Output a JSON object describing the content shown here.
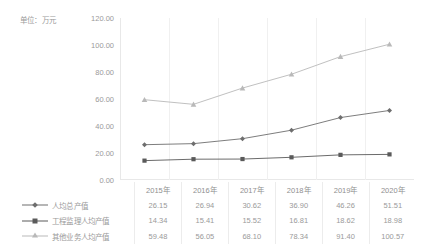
{
  "unit_caption": "单位：万元",
  "colors": {
    "series_total": "#6e6e6e",
    "series_supervision": "#5a5a5a",
    "series_other": "#b9b9b9",
    "grid": "#f0f0f0",
    "axis": "#e8e8e8",
    "text": "#9a9a9a",
    "table_border": "#ececec"
  },
  "chart_data": {
    "type": "line",
    "title": "",
    "subtitle": "",
    "xlabel": "",
    "ylabel": "",
    "unit": "单位：万元",
    "categories": [
      "2015年",
      "2016年",
      "2017年",
      "2018年",
      "2019年",
      "2020年"
    ],
    "ylim": [
      0,
      120
    ],
    "ytick_step": 20,
    "ytick_labels": [
      "0.00",
      "20.00",
      "40.00",
      "60.00",
      "80.00",
      "100.00",
      "120.00"
    ],
    "ytick_values": [
      0,
      20,
      40,
      60,
      80,
      100,
      120
    ],
    "grid": "vertical",
    "legend_position": "table-left",
    "series": [
      {
        "name": "人均总产值",
        "marker": "diamond",
        "color": "#6e6e6e",
        "values": [
          26.15,
          26.94,
          30.62,
          36.9,
          46.26,
          51.51
        ],
        "labels": [
          "26.15",
          "26.94",
          "30.62",
          "36.90",
          "46.26",
          "51.51"
        ]
      },
      {
        "name": "工程监理人均产值",
        "marker": "square",
        "color": "#5a5a5a",
        "values": [
          14.34,
          15.41,
          15.52,
          16.81,
          18.62,
          18.98
        ],
        "labels": [
          "14.34",
          "15.41",
          "15.52",
          "16.81",
          "18.62",
          "18.98"
        ]
      },
      {
        "name": "其他业务人均产值",
        "marker": "triangle",
        "color": "#b9b9b9",
        "values": [
          59.48,
          56.05,
          68.1,
          78.34,
          91.4,
          100.57
        ],
        "labels": [
          "59.48",
          "56.05",
          "68.10",
          "78.34",
          "91.40",
          "100.57"
        ]
      }
    ]
  }
}
